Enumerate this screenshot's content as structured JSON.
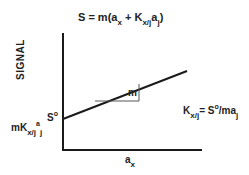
{
  "diagram": {
    "equation": {
      "lhs": "S = m(a",
      "sub_x": "x",
      "mid": "+ K",
      "sub_xj": "x/j",
      "a": "a",
      "sub_j": "j",
      "close": ")"
    },
    "y_axis_label": "SIGNAL",
    "x_axis_label": {
      "base": "a",
      "sub": "x"
    },
    "intercept_marker": {
      "base": "S",
      "sup": "o"
    },
    "intercept_expression": {
      "m": "mK",
      "sub_xj": "x/j",
      "a": "a",
      "sub_j": "j"
    },
    "slope_label": "m",
    "k_equation": {
      "k": "K",
      "sub_xj": "x/j",
      "eq": "=",
      "s": "S",
      "sup_o": "o",
      "rest": "/ma",
      "sub_j": "j"
    },
    "colors": {
      "line": "#1a1a1a",
      "triangle": "#555555",
      "background": "#ffffff"
    },
    "geometry": {
      "y_axis": {
        "x": 63,
        "y1": 33,
        "y2": 150
      },
      "x_axis": {
        "y": 150,
        "x1": 63,
        "x2": 202
      },
      "signal_line": {
        "x1": 63,
        "y1": 119,
        "x2": 187,
        "y2": 71
      },
      "slope_triangle": {
        "x1": 95,
        "x2": 139,
        "y_base": 101,
        "y_top": 84
      }
    }
  }
}
